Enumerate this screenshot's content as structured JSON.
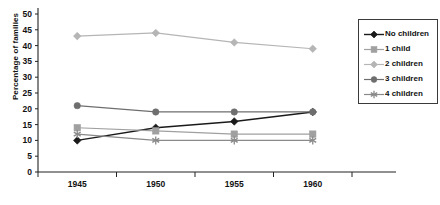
{
  "chart_data": {
    "type": "line",
    "title": "",
    "xlabel": "",
    "ylabel": "Percentage of families",
    "categories": [
      "1945",
      "1950",
      "1955",
      "1960"
    ],
    "ylim": [
      0,
      50
    ],
    "yticks": [
      "0",
      "5",
      "10",
      "15",
      "20",
      "25",
      "30",
      "35",
      "40",
      "45",
      "50"
    ],
    "grid": false,
    "legend_position": "right",
    "series": [
      {
        "name": "No children",
        "values": [
          10,
          14,
          16,
          19
        ],
        "marker": "diamond",
        "color": "#1a1a1a"
      },
      {
        "name": "1 child",
        "values": [
          14,
          13,
          12,
          12
        ],
        "marker": "square",
        "color": "#a0a0a0"
      },
      {
        "name": "2 children",
        "values": [
          43,
          44,
          41,
          39
        ],
        "marker": "diamond",
        "color": "#b5b5b5"
      },
      {
        "name": "3 children",
        "values": [
          21,
          19,
          19,
          19
        ],
        "marker": "circle",
        "color": "#6e6e6e"
      },
      {
        "name": "4 children",
        "values": [
          12,
          10,
          10,
          10
        ],
        "marker": "asterisk",
        "color": "#8a8a8a"
      }
    ]
  },
  "axis": {
    "color": "#222222"
  }
}
